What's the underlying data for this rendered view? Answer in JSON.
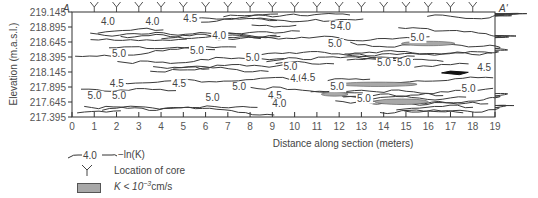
{
  "chart_data": {
    "type": "contour",
    "title": "",
    "section_labels": {
      "left": "A",
      "right": "A'"
    },
    "xlabel": "Distance along section (meters)",
    "ylabel": "Elevation (m.a.s.l.)",
    "xlim": [
      0,
      19
    ],
    "ylim": [
      217.395,
      219.145
    ],
    "x_ticks": [
      "0",
      "1",
      "2",
      "3",
      "4",
      "5",
      "6",
      "7",
      "8",
      "9",
      "10",
      "11",
      "12",
      "13",
      "14",
      "15",
      "16",
      "17",
      "18",
      "19"
    ],
    "y_ticks": [
      "219.145",
      "218.895",
      "218.645",
      "218.395",
      "218.145",
      "217.895",
      "217.645",
      "217.395"
    ],
    "core_locations_m": [
      1,
      2,
      3,
      4,
      5,
      6,
      7,
      8,
      9,
      10,
      11,
      12,
      13,
      14,
      15,
      16,
      17,
      18
    ],
    "contour_levels": [
      "4.0",
      "4.5",
      "5.0",
      "5.5"
    ],
    "contour_labels": [
      {
        "text": "4.0",
        "x": 1.3,
        "y": 218.93
      },
      {
        "text": "4.0",
        "x": 3.3,
        "y": 218.93
      },
      {
        "text": "4.5",
        "x": 5.0,
        "y": 218.98
      },
      {
        "text": "5.5",
        "x": 11.6,
        "y": 218.87
      },
      {
        "text": "4.0",
        "x": 11.9,
        "y": 218.84
      },
      {
        "text": "4.0",
        "x": 6.3,
        "y": 218.7
      },
      {
        "text": "5.0",
        "x": 11.5,
        "y": 218.56
      },
      {
        "text": "5.0",
        "x": 15.2,
        "y": 218.66
      },
      {
        "text": "5.0",
        "x": 1.8,
        "y": 218.4
      },
      {
        "text": "5.0",
        "x": 5.3,
        "y": 218.45
      },
      {
        "text": "5.0",
        "x": 7.8,
        "y": 218.33
      },
      {
        "text": "5.0",
        "x": 13.7,
        "y": 218.25
      },
      {
        "text": "5.0",
        "x": 14.6,
        "y": 218.24
      },
      {
        "text": "5.0",
        "x": 9.5,
        "y": 218.18
      },
      {
        "text": "4.5",
        "x": 18.2,
        "y": 218.16
      },
      {
        "text": "4.0",
        "x": 9.8,
        "y": 217.98
      },
      {
        "text": "4.5",
        "x": 10.3,
        "y": 218.0
      },
      {
        "text": "4.5",
        "x": 1.7,
        "y": 217.9
      },
      {
        "text": "4.5",
        "x": 4.5,
        "y": 217.89
      },
      {
        "text": "5.0",
        "x": 7.2,
        "y": 217.84
      },
      {
        "text": "5.0",
        "x": 11.6,
        "y": 217.84
      },
      {
        "text": "5.0",
        "x": 17.5,
        "y": 217.82
      },
      {
        "text": "5.0",
        "x": 0.7,
        "y": 217.7
      },
      {
        "text": "5.0",
        "x": 1.8,
        "y": 217.7
      },
      {
        "text": "5.0",
        "x": 6.0,
        "y": 217.67
      },
      {
        "text": "4.5",
        "x": 8.8,
        "y": 217.7
      },
      {
        "text": "4.0",
        "x": 9.0,
        "y": 217.57
      },
      {
        "text": "5.0",
        "x": 12.8,
        "y": 217.65
      }
    ],
    "low_k_zones": "gray shaded (K < 10^-3 cm/s) near x=3-4, 10-12, 13-17",
    "grid": false,
    "legend_position": "bottom-left"
  },
  "legend": {
    "contour_sample": "4.0",
    "contour_text": "−ln(K)",
    "core_text": "Location of core",
    "lowk_text_pre": "K < 10",
    "lowk_exp": "−3",
    "lowk_unit": "cm/s"
  },
  "colors": {
    "line": "#3a3a3a",
    "shade": "#a8a8a8",
    "dark": "#111111",
    "text": "#444444"
  }
}
